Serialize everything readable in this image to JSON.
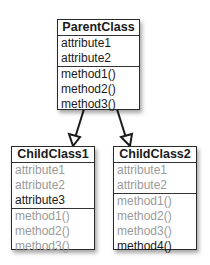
{
  "diagram": {
    "type": "UML class diagram",
    "parent": {
      "name": "ParentClass",
      "attributes": [
        {
          "label": "attribute1",
          "inherited": false
        },
        {
          "label": "attribute2",
          "inherited": false
        }
      ],
      "methods": [
        {
          "label": "method1()",
          "inherited": false
        },
        {
          "label": "method2()",
          "inherited": false
        },
        {
          "label": "method3()",
          "inherited": false
        }
      ]
    },
    "children": [
      {
        "name": "ChildClass1",
        "attributes": [
          {
            "label": "attribute1",
            "inherited": true
          },
          {
            "label": "attribute2",
            "inherited": true
          },
          {
            "label": "attribute3",
            "inherited": false
          }
        ],
        "methods": [
          {
            "label": "method1()",
            "inherited": true
          },
          {
            "label": "method2()",
            "inherited": true
          },
          {
            "label": "method3()",
            "inherited": true
          }
        ]
      },
      {
        "name": "ChildClass2",
        "attributes": [
          {
            "label": "attribute1",
            "inherited": true
          },
          {
            "label": "attribute2",
            "inherited": true
          }
        ],
        "methods": [
          {
            "label": "method1()",
            "inherited": true
          },
          {
            "label": "method2()",
            "inherited": true
          },
          {
            "label": "method3()",
            "inherited": true
          },
          {
            "label": "method4()",
            "inherited": false
          }
        ]
      }
    ],
    "colors": {
      "own_member": "#1a1a1a",
      "inherited_member": "#9a9a9a",
      "border": "#2a2a2a"
    }
  }
}
